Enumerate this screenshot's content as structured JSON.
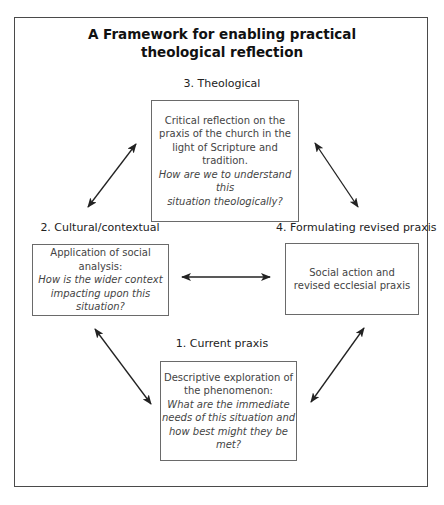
{
  "diagram": {
    "title_line1": "A Framework for enabling practical",
    "title_line2": "theological reflection",
    "stages": [
      {
        "id": "theological",
        "label": "3. Theological",
        "description": "Critical reflection on the praxis of the church in the light of Scripture and tradition.",
        "description_lines": [
          "Critical reflection on the",
          "praxis of the church in the",
          "light of Scripture and tradition."
        ],
        "question_lines": [
          "How are we to understand this",
          "situation theologically?"
        ]
      },
      {
        "id": "cultural",
        "label": "2. Cultural/contextual",
        "description_lines": [
          "Application of social analysis:"
        ],
        "question_lines": [
          "How is the wider context",
          "impacting upon this situation?"
        ]
      },
      {
        "id": "revised",
        "label": "4. Formulating revised praxis",
        "description_lines": [
          "Social action and",
          "revised ecclesial praxis"
        ],
        "question_lines": []
      },
      {
        "id": "current",
        "label": "1. Current praxis",
        "description_lines": [
          "Descriptive exploration of",
          "the phenomenon:"
        ],
        "question_lines": [
          "What are the immediate",
          "needs of this situation and",
          "how best might they be met?"
        ]
      }
    ],
    "connections": [
      {
        "from": "cultural",
        "to": "theological",
        "type": "bidirectional"
      },
      {
        "from": "theological",
        "to": "revised",
        "type": "bidirectional"
      },
      {
        "from": "cultural",
        "to": "revised",
        "type": "bidirectional"
      },
      {
        "from": "cultural",
        "to": "current",
        "type": "bidirectional"
      },
      {
        "from": "current",
        "to": "revised",
        "type": "bidirectional"
      }
    ],
    "colors": {
      "frame": "#4a4a4a",
      "box_border": "#6a6a6a",
      "arrow": "#222222",
      "title_text": "#111111",
      "body_text": "#444444"
    }
  }
}
